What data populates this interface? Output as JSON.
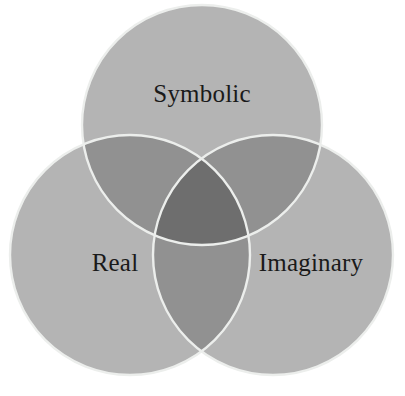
{
  "figure": {
    "name": "borromean-venn-diagram",
    "background_color": "#ffffff",
    "width": 405,
    "height": 396
  },
  "palette": {
    "single_fill": "#b4b4b4",
    "double_overlap_fill": "#919191",
    "triple_overlap_fill": "#6e6e6e",
    "outline_stroke": "#eceeec",
    "label_color": "#1a1a1a",
    "background": "#ffffff"
  },
  "chart_data": {
    "type": "venn",
    "title": "",
    "sets": [
      {
        "id": "symbolic",
        "label": "Symbolic",
        "cx": 202,
        "cy": 125,
        "r": 120,
        "label_x": 202,
        "label_y": 96
      },
      {
        "id": "real",
        "label": "Real",
        "cx": 130,
        "cy": 255,
        "r": 120,
        "label_x": 115,
        "label_y": 265
      },
      {
        "id": "imaginary",
        "label": "Imaginary",
        "cx": 273,
        "cy": 255,
        "r": 120,
        "label_x": 311,
        "label_y": 265
      }
    ],
    "regions": [
      {
        "id": "symbolic-only",
        "sets": [
          "symbolic"
        ],
        "shade": "single"
      },
      {
        "id": "real-only",
        "sets": [
          "real"
        ],
        "shade": "single"
      },
      {
        "id": "imaginary-only",
        "sets": [
          "imaginary"
        ],
        "shade": "single"
      },
      {
        "id": "symbolic-real",
        "sets": [
          "symbolic",
          "real"
        ],
        "shade": "double"
      },
      {
        "id": "symbolic-imaginary",
        "sets": [
          "symbolic",
          "imaginary"
        ],
        "shade": "double"
      },
      {
        "id": "real-imaginary",
        "sets": [
          "real",
          "imaginary"
        ],
        "shade": "double"
      },
      {
        "id": "symbolic-real-imaginary",
        "sets": [
          "symbolic",
          "real",
          "imaginary"
        ],
        "shade": "triple"
      }
    ],
    "legend": null,
    "annotations": []
  },
  "labels": {
    "symbolic": "Symbolic",
    "real": "Real",
    "imaginary": "Imaginary"
  }
}
